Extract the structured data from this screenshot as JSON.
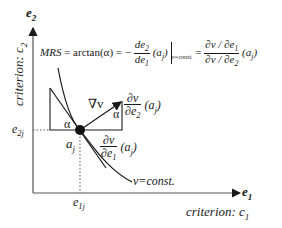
{
  "axes": {
    "y_axis_label": "e",
    "y_axis_sub": "2",
    "y_criterion": "criterion: c",
    "y_criterion_sub": "2",
    "x_axis_label": "e",
    "x_axis_sub": "1",
    "x_criterion": "criterion: c",
    "x_criterion_sub": "1"
  },
  "point": {
    "label": "a",
    "label_sub": "j",
    "e1_tick": "e",
    "e1_tick_sub": "1j",
    "e2_tick": "e",
    "e2_tick_sub": "2j"
  },
  "formula": {
    "lhs": "MRS",
    "eq1": " = arctan(α) = −",
    "num1": "de",
    "num1_sub": "2",
    "den1": "de",
    "den1_sub": "1",
    "arg1": "(a",
    "arg1_sub": "j",
    "arg1_close": ")",
    "cond": "v=const.",
    "eq2": "=",
    "num2": "∂v / ∂e",
    "num2_sub": "1",
    "den2": "∂v / ∂e",
    "den2_sub": "2",
    "arg2": "(a",
    "arg2_sub": "j",
    "arg2_close": ")"
  },
  "labels": {
    "gradient": "∇v",
    "alpha_left": "α",
    "alpha_right": "α",
    "partial_e2_num": "∂v",
    "partial_e2_den": "∂e",
    "partial_e2_den_sub": "2",
    "partial_e2_arg": "(a",
    "partial_e2_arg_sub": "j",
    "partial_e2_close": ")",
    "partial_e1_num": "∂v",
    "partial_e1_den": "∂e",
    "partial_e1_den_sub": "1",
    "partial_e1_arg": "(a",
    "partial_e1_arg_sub": "j",
    "partial_e1_close": ")",
    "curve": "v=const."
  },
  "colors": {
    "ink": "#1a1a1a",
    "axis": "#555555"
  }
}
